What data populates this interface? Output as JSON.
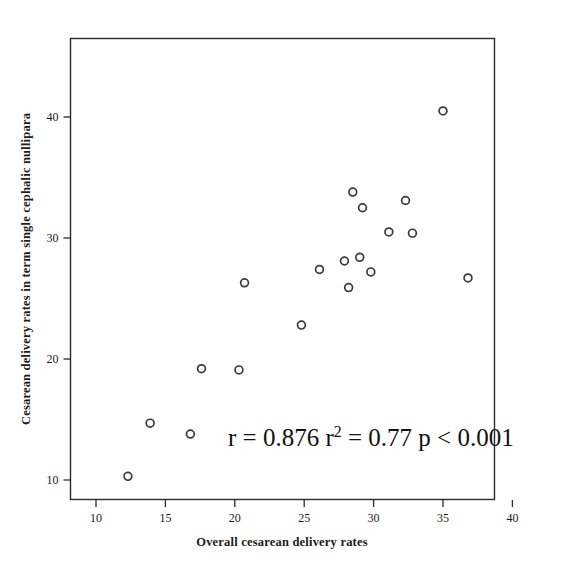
{
  "chart_data": {
    "type": "scatter",
    "title": "",
    "xlabel": "Overall cesarean delivery rates",
    "ylabel": "Cesarean delivery rates in term single cephalic nullipara",
    "xlim": [
      8.1,
      40.7
    ],
    "ylim": [
      8.4,
      45.0
    ],
    "xticks": [
      10,
      15,
      20,
      25,
      30,
      35,
      40
    ],
    "xtick_labels": [
      "10",
      "15",
      "20",
      "25",
      "30",
      "35",
      "40"
    ],
    "yticks": [
      10,
      20,
      30,
      40
    ],
    "ytick_labels": [
      "10",
      "20",
      "30",
      "40"
    ],
    "grid": false,
    "legend": null,
    "marker": "open-circle",
    "marker_color": "#3a3a44",
    "points": [
      {
        "x": 12.3,
        "y": 10.3
      },
      {
        "x": 13.9,
        "y": 14.7
      },
      {
        "x": 16.8,
        "y": 13.8
      },
      {
        "x": 17.6,
        "y": 19.2
      },
      {
        "x": 20.3,
        "y": 19.1
      },
      {
        "x": 20.7,
        "y": 26.3
      },
      {
        "x": 24.8,
        "y": 22.8
      },
      {
        "x": 26.1,
        "y": 27.4
      },
      {
        "x": 27.9,
        "y": 28.1
      },
      {
        "x": 28.2,
        "y": 25.9
      },
      {
        "x": 28.5,
        "y": 33.8
      },
      {
        "x": 29.0,
        "y": 28.4
      },
      {
        "x": 29.2,
        "y": 32.5
      },
      {
        "x": 29.8,
        "y": 27.2
      },
      {
        "x": 31.1,
        "y": 30.5
      },
      {
        "x": 32.3,
        "y": 33.1
      },
      {
        "x": 32.8,
        "y": 30.4
      },
      {
        "x": 35.0,
        "y": 40.5
      },
      {
        "x": 36.8,
        "y": 26.7
      }
    ],
    "annotations": [
      {
        "id": "stats-annotation",
        "parts": [
          {
            "text": "r = 0.876 r",
            "sup": false
          },
          {
            "text": "2",
            "sup": true
          },
          {
            "text": " = 0.77 p < 0.001",
            "sup": false
          }
        ],
        "full_text": "r = 0.876 r2 = 0.77 p < 0.001",
        "x": 25.3,
        "y": 12.6
      }
    ],
    "statistics": {
      "r": "0.876",
      "r_squared": "0.77",
      "p_value": "< 0.001"
    }
  }
}
